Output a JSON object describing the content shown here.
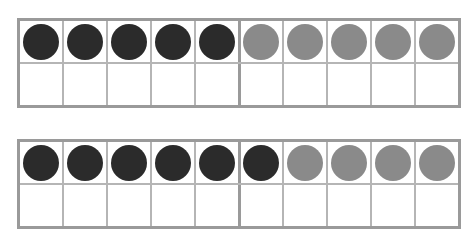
{
  "page": {
    "background_color": "#ffffff",
    "width": 475,
    "height": 237
  },
  "style": {
    "counter_dark_color": "#2b2b2b",
    "counter_light_color": "#8a8a8a",
    "grid_line_color": "#b5b5b5",
    "outer_border_color": "#9a9a9a",
    "cell_fill_color": "#ffffff"
  },
  "chart_data": {
    "type": "table",
    "xlabel": "",
    "ylabel": "",
    "categories": [
      "Ten frame 1",
      "Ten frame 2"
    ],
    "values": [
      10,
      10
    ],
    "series": [
      {
        "name": "dark counters",
        "values": [
          5,
          6
        ]
      },
      {
        "name": "light counters",
        "values": [
          5,
          4
        ]
      },
      {
        "name": "empty cells",
        "values": [
          10,
          10
        ]
      }
    ],
    "legend": [
      "dark counter",
      "light counter",
      "empty cell"
    ],
    "grid": true
  },
  "frames": [
    {
      "name": "ten-frame-1",
      "columns": 10,
      "rows": 2,
      "dark_count": 5,
      "light_count": 5,
      "empty_count": 10,
      "total_counters": 10,
      "cells": [
        [
          "dark",
          "dark",
          "dark",
          "dark",
          "dark",
          "light",
          "light",
          "light",
          "light",
          "light"
        ],
        [
          "empty",
          "empty",
          "empty",
          "empty",
          "empty",
          "empty",
          "empty",
          "empty",
          "empty",
          "empty"
        ]
      ]
    },
    {
      "name": "ten-frame-2",
      "columns": 10,
      "rows": 2,
      "dark_count": 6,
      "light_count": 4,
      "empty_count": 10,
      "total_counters": 10,
      "cells": [
        [
          "dark",
          "dark",
          "dark",
          "dark",
          "dark",
          "dark",
          "light",
          "light",
          "light",
          "light"
        ],
        [
          "empty",
          "empty",
          "empty",
          "empty",
          "empty",
          "empty",
          "empty",
          "empty",
          "empty",
          "empty"
        ]
      ]
    }
  ]
}
